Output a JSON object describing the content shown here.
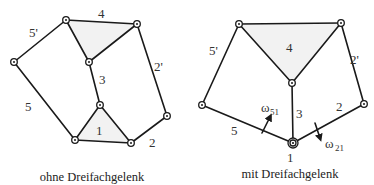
{
  "left_diagram": {
    "caption": "ohne Dreifachgelenk",
    "labels": {
      "link_1": "1",
      "link_2": "2",
      "link_2p": "2'",
      "link_3": "3",
      "link_4": "4",
      "link_5": "5",
      "link_5p": "5'"
    }
  },
  "right_diagram": {
    "caption": "mit Dreifachgelenk",
    "labels": {
      "link_1": "1",
      "link_2": "2",
      "link_2p": "2'",
      "link_3": "3",
      "link_4": "4",
      "link_5": "5",
      "link_5p": "5'",
      "omega_51": "ω",
      "omega_51_sub": "51",
      "omega_21": "ω",
      "omega_21_sub": "21"
    }
  },
  "colors": {
    "line": "#1a1a1a",
    "fill": "#f2f2f2",
    "text": "#333333"
  }
}
